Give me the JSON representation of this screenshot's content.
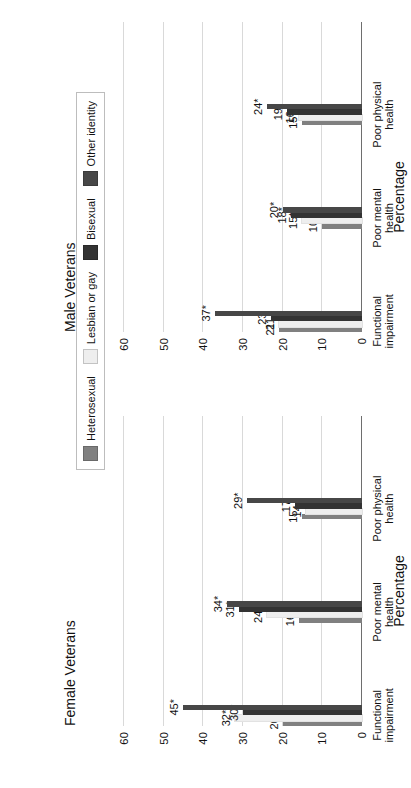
{
  "figure": {
    "ylabel": "Percentage",
    "yticks": [
      0,
      10,
      20,
      30,
      40,
      50,
      60
    ],
    "ymax": 65,
    "categories": [
      "Functional impairment",
      "Poor mental health",
      "Poor physical health"
    ],
    "legend": {
      "items": [
        {
          "label": "Heterosexual",
          "color": "#808080"
        },
        {
          "label": "Lesbian or gay",
          "color": "#eeeeee"
        },
        {
          "label": "Bisexual",
          "color": "#333333"
        },
        {
          "label": "Other identity",
          "color": "#474747"
        }
      ]
    },
    "panels": [
      {
        "id": "male",
        "title": "Male Veterans",
        "groups": [
          {
            "category": "Functional impairment",
            "labels": [
              "21",
              "21",
              "23",
              "37*"
            ],
            "values": [
              21,
              21,
              23,
              37
            ]
          },
          {
            "category": "Poor mental health",
            "labels": [
              "10",
              "15*",
              "18*",
              "20*"
            ],
            "values": [
              10,
              15,
              18,
              20
            ]
          },
          {
            "category": "Poor physical health",
            "labels": [
              "15",
              "16",
              "19*",
              "24*"
            ],
            "values": [
              15,
              16,
              19,
              24
            ]
          }
        ]
      },
      {
        "id": "female",
        "title": "Female Veterans",
        "groups": [
          {
            "category": "Functional impairment",
            "labels": [
              "20",
              "32*",
              "30*",
              "45*"
            ],
            "values": [
              20,
              32,
              30,
              45
            ]
          },
          {
            "category": "Poor mental health",
            "labels": [
              "16",
              "24*",
              "31*",
              "34*"
            ],
            "values": [
              16,
              24,
              31,
              34
            ]
          },
          {
            "category": "Poor physical health",
            "labels": [
              "15",
              "14",
              "17",
              "29*"
            ],
            "values": [
              15,
              14,
              17,
              29
            ]
          }
        ]
      }
    ]
  },
  "chart_data": {
    "type": "bar",
    "title": "",
    "xlabel": "",
    "ylabel": "Percentage",
    "ylim": [
      0,
      65
    ],
    "yticks": [
      0,
      10,
      20,
      30,
      40,
      50,
      60
    ],
    "grid": true,
    "legend_position": "center-right",
    "categories": [
      "Functional impairment",
      "Poor mental health",
      "Poor physical health"
    ],
    "panels": [
      {
        "name": "Male Veterans",
        "series": [
          {
            "name": "Heterosexual",
            "values": [
              21,
              10,
              15
            ],
            "labels": [
              "21",
              "10",
              "15"
            ]
          },
          {
            "name": "Lesbian or gay",
            "values": [
              21,
              15,
              16
            ],
            "labels": [
              "21",
              "15*",
              "16"
            ]
          },
          {
            "name": "Bisexual",
            "values": [
              23,
              18,
              19
            ],
            "labels": [
              "23",
              "18*",
              "19*"
            ]
          },
          {
            "name": "Other identity",
            "values": [
              37,
              20,
              24
            ],
            "labels": [
              "37*",
              "20*",
              "24*"
            ]
          }
        ]
      },
      {
        "name": "Female Veterans",
        "series": [
          {
            "name": "Heterosexual",
            "values": [
              20,
              16,
              15
            ],
            "labels": [
              "20",
              "16",
              "15"
            ]
          },
          {
            "name": "Lesbian or gay",
            "values": [
              32,
              24,
              14
            ],
            "labels": [
              "32*",
              "24*",
              "14"
            ]
          },
          {
            "name": "Bisexual",
            "values": [
              30,
              31,
              17
            ],
            "labels": [
              "30*",
              "31*",
              "17"
            ]
          },
          {
            "name": "Other identity",
            "values": [
              45,
              34,
              29
            ],
            "labels": [
              "45*",
              "34*",
              "29*"
            ]
          }
        ]
      }
    ],
    "note": "Asterisk (*) on a data label denotes a statistically significant difference versus the heterosexual reference group."
  }
}
